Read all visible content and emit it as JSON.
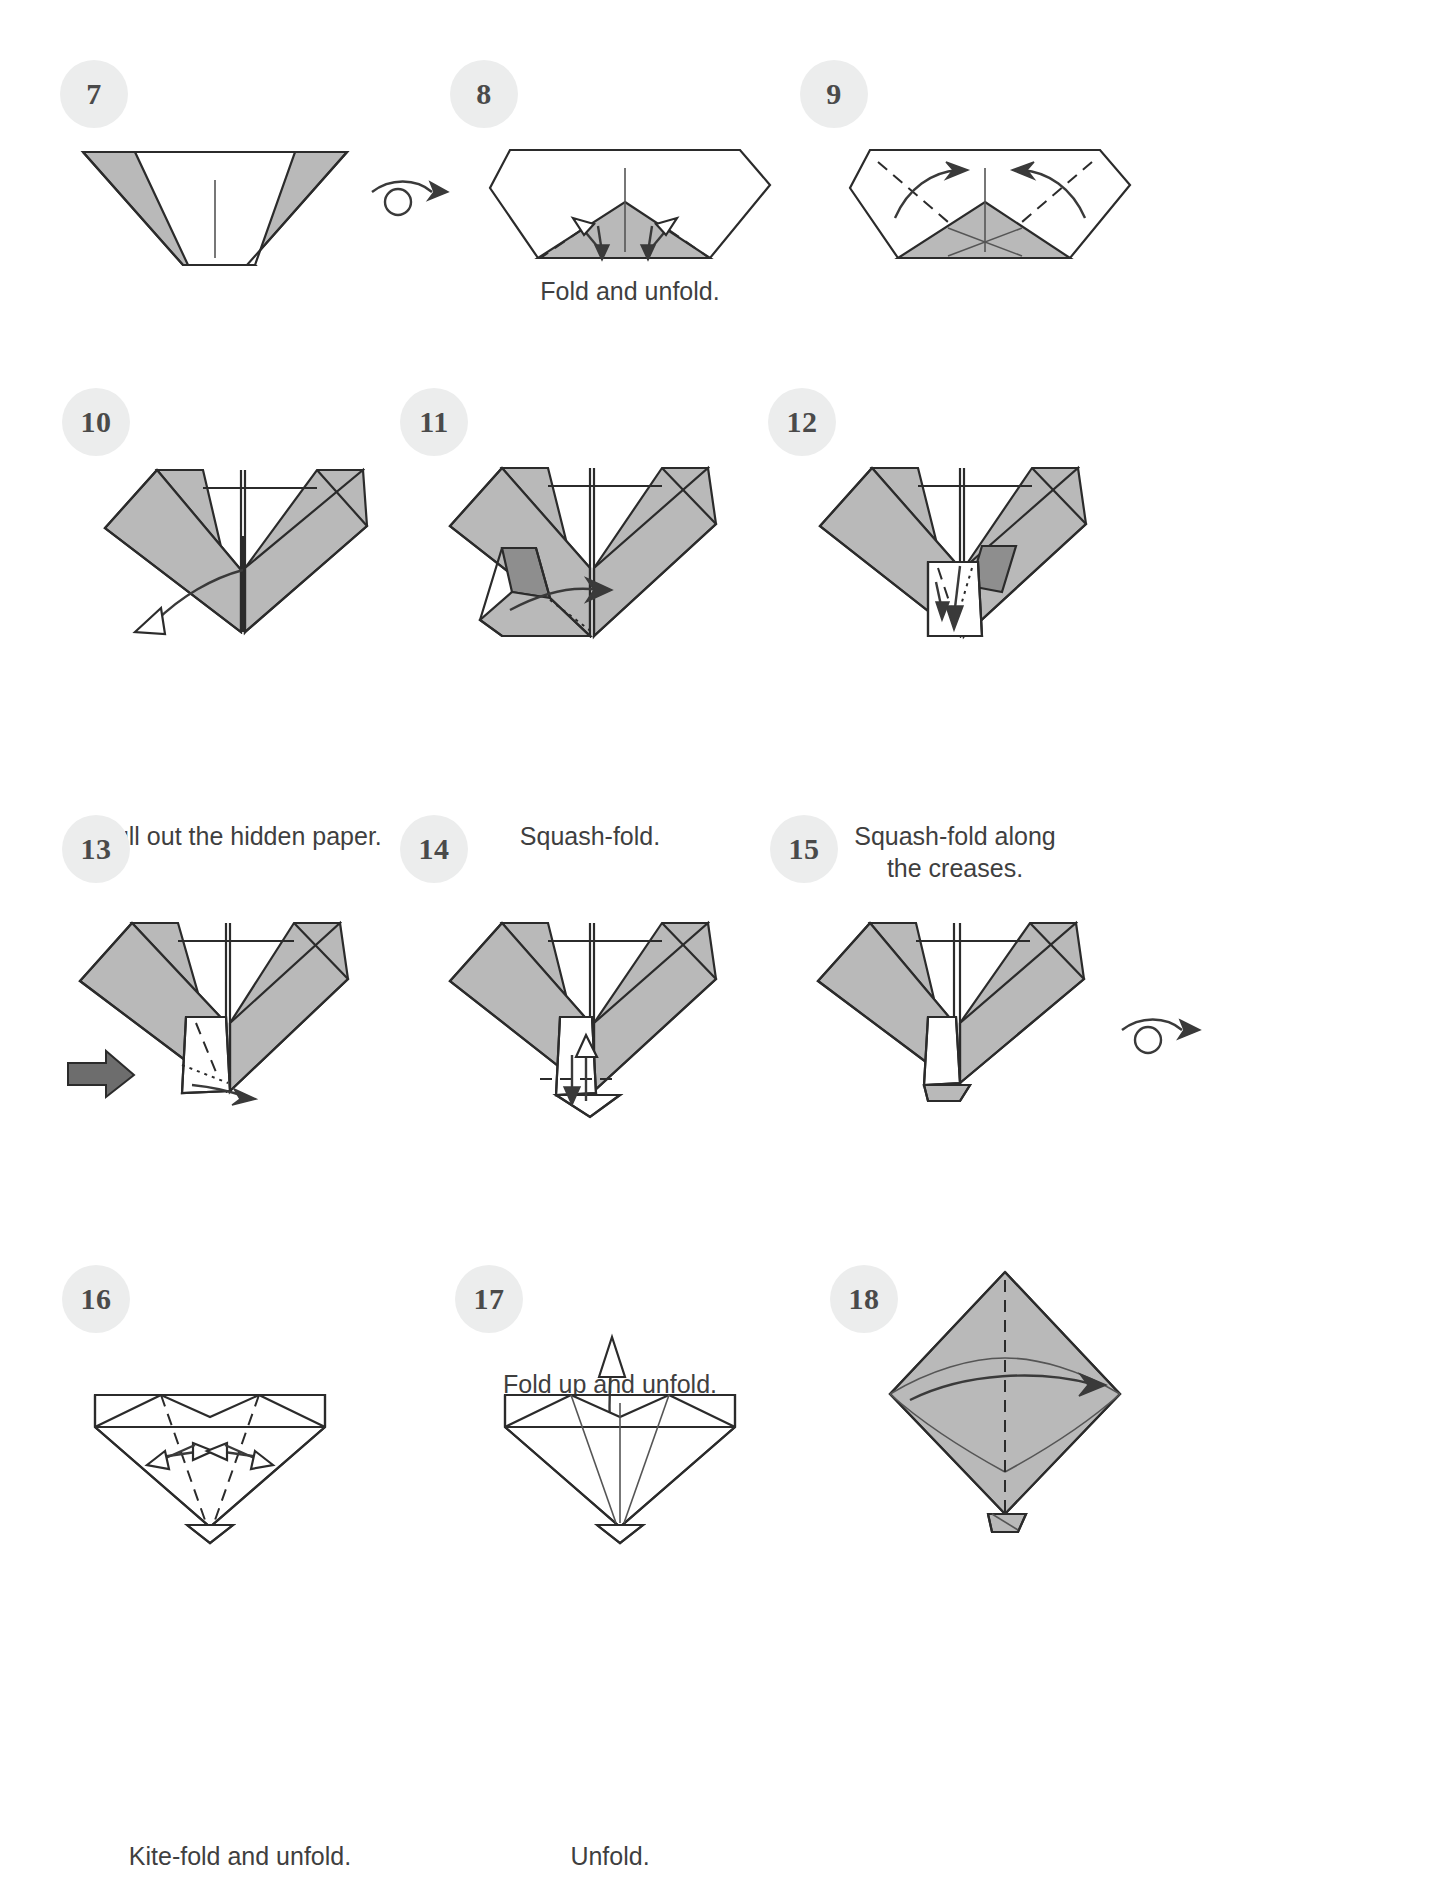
{
  "page": {
    "kind": "origami-instruction-diagram",
    "background_color": "#ffffff",
    "paper_front_color": "#b9b9b9",
    "paper_back_color": "#ffffff",
    "paper_shadow_color": "#8e8e8e",
    "line_color": "#2b2b2b",
    "badge_bg_color": "#eceded",
    "badge_text_color": "#4a4a4a",
    "caption_color": "#3f3f3f",
    "columns": 3,
    "rows": 4
  },
  "steps": [
    {
      "number": "7",
      "caption": "",
      "row": 1,
      "col": 1,
      "figure": "wide-v-shape-gray-flaps-with-center-crease",
      "has_turnover_symbol_after": true
    },
    {
      "number": "8",
      "caption": "Fold and unfold.",
      "row": 1,
      "col": 2,
      "figure": "pentagon-with-gray-triangle-and-four-fold-arrows"
    },
    {
      "number": "9",
      "caption": "",
      "row": 1,
      "col": 3,
      "figure": "pentagon-with-gray-triangle-and-two-valley-fold-arrows"
    },
    {
      "number": "10",
      "caption": "Pull out the hidden paper.",
      "row": 2,
      "col": 1,
      "figure": "v-shape-with-pull-out-arrow"
    },
    {
      "number": "11",
      "caption": "Squash-fold.",
      "row": 2,
      "col": 2,
      "figure": "v-shape-with-squash-fold-arrow-and-push-arrow"
    },
    {
      "number": "12",
      "caption": "Squash-fold along\nthe creases.",
      "row": 2,
      "col": 3,
      "figure": "v-shape-with-squash-fold-creases"
    },
    {
      "number": "13",
      "caption": "",
      "row": 3,
      "col": 1,
      "figure": "v-shape-with-push-arrow-left"
    },
    {
      "number": "14",
      "caption": "Fold up and unfold.",
      "row": 3,
      "col": 2,
      "figure": "v-shape-with-fold-up-arrow"
    },
    {
      "number": "15",
      "caption": "",
      "row": 3,
      "col": 3,
      "figure": "v-shape-with-turnover-symbol",
      "has_turnover_symbol_after": true
    },
    {
      "number": "16",
      "caption": "Kite-fold and unfold.",
      "row": 4,
      "col": 1,
      "figure": "kite-shape-with-two-fold-arrows"
    },
    {
      "number": "17",
      "caption": "Unfold.",
      "row": 4,
      "col": 2,
      "figure": "kite-shape-with-unfold-arrow"
    },
    {
      "number": "18",
      "caption": "",
      "row": 4,
      "col": 3,
      "figure": "gray-diamond-with-center-crease-and-horizontal-arrow"
    }
  ],
  "symbols": {
    "turnover": "turn-over-arrow",
    "valley_fold": "dashed-line",
    "hidden_edge": "dotted-line",
    "push_here": "solid-black-arrow",
    "unfold": "hollow-white-arrow"
  }
}
